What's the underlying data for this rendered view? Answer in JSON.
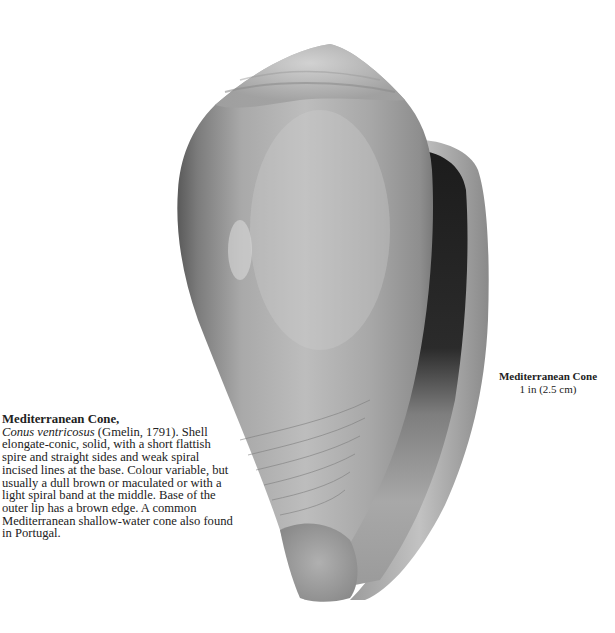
{
  "specimen": {
    "common_name": "Mediterranean Cone,",
    "scientific_name": "Conus ventricosus",
    "authority": " (Gmelin, 1791).",
    "description": "Shell elongate-conic, solid, with a short flattish spire and straight sides and weak spiral incised lines at the base. Colour variable, but usually a dull brown or maculated or with a light spiral band at the middle. Base of the outer lip has a brown edge. A common Mediterranean shallow-water cone also found in Portugal."
  },
  "caption": {
    "title": "Mediterranean Cone",
    "size": "1 in (2.5 cm)"
  },
  "image": {
    "subject": "cone-shell-photograph",
    "tone": "grayscale"
  }
}
